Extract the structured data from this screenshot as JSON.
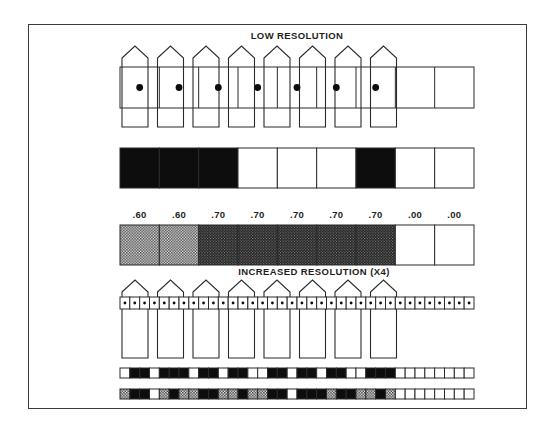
{
  "figure": {
    "title_low": "LOW RESOLUTION",
    "title_high": "INCREASED RESOLUTION (X4)",
    "ink": "#2b2b2b",
    "black": "#0d0d0d",
    "white": "#ffffff",
    "stipple_light_avg": "#9a9a9a",
    "stipple_dark_avg": "#3d3d3d",
    "border": {
      "x": 28,
      "y": 24,
      "width": 499,
      "height": 385
    },
    "grid": {
      "x": 120,
      "width": 354,
      "low_cells": 9,
      "high_cells": 36
    },
    "low": {
      "pickets": {
        "count": 8,
        "first_center": 135,
        "pitch": 35.5,
        "width": 26,
        "apex_y": 46,
        "shoulder_y": 58,
        "bottom_y": 127
      },
      "sample_bar": {
        "y": 67,
        "height": 41,
        "dot_count": 7,
        "dot_radius": 3.4
      },
      "occupancy_bar": {
        "y": 148,
        "height": 40,
        "cells": [
          "B",
          "B",
          "B",
          "W",
          "W",
          "W",
          "B",
          "W",
          "W"
        ]
      },
      "probability_bar": {
        "y": 225,
        "height": 40,
        "labels": [
          ".60",
          ".60",
          ".70",
          ".70",
          ".70",
          ".70",
          ".70",
          ".00",
          ".00"
        ],
        "cells": [
          "P60",
          "P60",
          "P70",
          "P70",
          "P70",
          "P70",
          "P70",
          "W",
          "W"
        ]
      }
    },
    "high": {
      "pickets": {
        "count": 8,
        "first_center": 135,
        "pitch": 35.5,
        "width": 26,
        "apex_y": 280,
        "shoulder_y": 292,
        "bottom_y": 358
      },
      "sample_strip": {
        "y": 297,
        "height": 12,
        "dot_count": 36,
        "dot_radius": 1.4
      },
      "occupancy_strip": {
        "y": 368,
        "height": 10,
        "cells": [
          "W",
          "B",
          "B",
          "W",
          "B",
          "B",
          "B",
          "W",
          "B",
          "B",
          "W",
          "B",
          "B",
          "W",
          "W",
          "B",
          "B",
          "W",
          "B",
          "B",
          "W",
          "B",
          "B",
          "W",
          "W",
          "B",
          "B",
          "B",
          "W",
          "W",
          "W",
          "W",
          "W",
          "W",
          "W",
          "W"
        ]
      },
      "probability_strip": {
        "y": 389,
        "height": 10,
        "cells": [
          "S",
          "B",
          "B",
          "W",
          "S",
          "B",
          "S",
          "S",
          "B",
          "B",
          "S",
          "S",
          "B",
          "S",
          "S",
          "B",
          "B",
          "W",
          "B",
          "B",
          "B",
          "S",
          "B",
          "B",
          "S",
          "S",
          "B",
          "S",
          "W",
          "W",
          "W",
          "W",
          "W",
          "W",
          "W",
          "W"
        ]
      }
    }
  }
}
